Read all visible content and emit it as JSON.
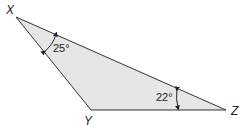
{
  "diagram": {
    "type": "triangle",
    "fill_color": "#e6e6e6",
    "stroke_color": "#333333",
    "vertices": {
      "X": {
        "label": "X"
      },
      "Y": {
        "label": "Y"
      },
      "Z": {
        "label": "Z"
      }
    },
    "angles": {
      "X": {
        "value": "25°"
      },
      "Z": {
        "value": "22°"
      }
    }
  }
}
